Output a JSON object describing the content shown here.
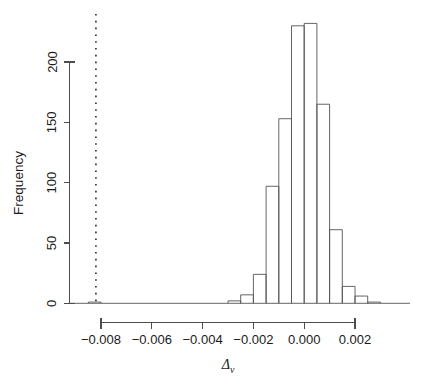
{
  "figure": {
    "width": 421,
    "height": 386,
    "background": "#ffffff",
    "foreground": "#1a1a1a"
  },
  "axes": {
    "y_title": "Frequency",
    "x_title_base": "Δ",
    "x_title_sub": "v",
    "y_ticks": [
      "0",
      "50",
      "100",
      "150",
      "200"
    ],
    "x_ticks": [
      "-0.008",
      "-0.006",
      "-0.004",
      "-0.002",
      "0.000",
      "0.002"
    ]
  },
  "annotations": {
    "reference_line_label": "vertical-dotted-reference-line",
    "reference_line_value": -0.0082,
    "reference_line_color": "#333333"
  },
  "chart_data": {
    "type": "bar",
    "title": "",
    "subtitle": "",
    "xlabel": "Δ_v",
    "ylabel": "Frequency",
    "grid": false,
    "legend": null,
    "xlim": [
      -0.0085,
      0.0032
    ],
    "ylim": [
      0,
      241
    ],
    "y_ticks": [
      0,
      50,
      100,
      150,
      200
    ],
    "x_ticks": [
      -0.008,
      -0.006,
      -0.004,
      -0.002,
      0.0,
      0.002
    ],
    "bin_width": 0.0005,
    "bin_edges": [
      -0.0085,
      -0.008,
      -0.0075,
      -0.007,
      -0.0065,
      -0.006,
      -0.0055,
      -0.005,
      -0.0045,
      -0.004,
      -0.0035,
      -0.003,
      -0.0025,
      -0.002,
      -0.0015,
      -0.001,
      -0.0005,
      0.0,
      0.0005,
      0.001,
      0.0015,
      0.002,
      0.0025,
      0.003
    ],
    "bin_centers": [
      -0.00825,
      -0.00775,
      -0.00725,
      -0.00675,
      -0.00625,
      -0.00575,
      -0.00525,
      -0.00475,
      -0.00425,
      -0.00375,
      -0.00325,
      -0.00275,
      -0.00225,
      -0.00175,
      -0.00125,
      -0.00075,
      -0.00025,
      0.00025,
      0.00075,
      0.00125,
      0.00175,
      0.00225,
      0.00275
    ],
    "categories": [
      "-0.00825",
      "-0.00775",
      "-0.00725",
      "-0.00675",
      "-0.00625",
      "-0.00575",
      "-0.00525",
      "-0.00475",
      "-0.00425",
      "-0.00375",
      "-0.00325",
      "-0.00275",
      "-0.00225",
      "-0.00175",
      "-0.00125",
      "-0.00075",
      "-0.00025",
      "0.00025",
      "0.00075",
      "0.00125",
      "0.00175",
      "0.00225",
      "0.00275"
    ],
    "values": [
      1,
      0,
      0,
      0,
      0,
      0,
      0,
      0,
      0,
      0,
      0,
      2,
      7,
      24,
      97,
      153,
      230,
      232,
      165,
      61,
      14,
      6,
      1
    ],
    "annotations": [
      {
        "type": "vline",
        "x": -0.0082,
        "style": "dotted",
        "color": "#333333"
      }
    ]
  }
}
